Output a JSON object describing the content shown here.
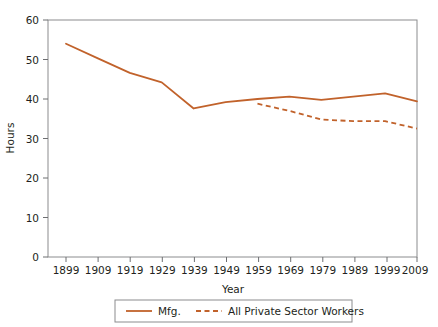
{
  "chart_data": {
    "type": "line",
    "title": "",
    "subtitle": "",
    "xlabel": "Year",
    "ylabel": "Hours",
    "x": [
      1899,
      1909,
      1919,
      1929,
      1939,
      1949,
      1959,
      1969,
      1979,
      1989,
      1999,
      2009
    ],
    "xtick_labels": [
      "1899",
      "1909",
      "1919",
      "1929",
      "1939",
      "1949",
      "1959",
      "1969",
      "1979",
      "1989",
      "1999",
      "2009"
    ],
    "ytick_labels": [
      "0",
      "10",
      "20",
      "30",
      "40",
      "50",
      "60"
    ],
    "yticks": [
      0,
      10,
      20,
      30,
      40,
      50,
      60
    ],
    "xlim": [
      1894,
      2014
    ],
    "ylim": [
      0,
      60
    ],
    "grid": false,
    "legend_position": "bottom-center",
    "series": [
      {
        "name": "Mfg.",
        "style": "solid",
        "color": "#C1622B",
        "x": [
          1899,
          1909,
          1919,
          1929,
          1939,
          1949,
          1959,
          1969,
          1979,
          1989,
          1999,
          2009
        ],
        "values": [
          54.0,
          50.3,
          46.6,
          44.2,
          37.6,
          39.2,
          40.0,
          40.6,
          39.8,
          40.6,
          41.4,
          39.4
        ]
      },
      {
        "name": "All Private Sector Workers",
        "style": "dashed",
        "color": "#C1622B",
        "x": [
          1959,
          1969,
          1979,
          1989,
          1999,
          2009
        ],
        "values": [
          38.8,
          37.0,
          34.8,
          34.4,
          34.4,
          32.5
        ]
      }
    ]
  },
  "axes": {
    "y_title": "Hours",
    "x_title": "Year"
  },
  "legend": {
    "items": [
      {
        "label": "Mfg.",
        "style": "solid",
        "color": "#C1622B"
      },
      {
        "label": "All Private Sector Workers",
        "style": "dashed",
        "color": "#C1622B"
      }
    ]
  },
  "colors": {
    "line": "#C1622B",
    "axis": "#6d6e71",
    "text": "#231f20",
    "background": "#ffffff"
  }
}
